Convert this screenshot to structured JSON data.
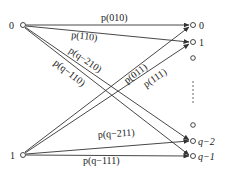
{
  "diagram": {
    "type": "channel transition diagram",
    "left_nodes": [
      {
        "id": "L0",
        "label": "0",
        "x": 23,
        "y": 25
      },
      {
        "id": "L1",
        "label": "1",
        "x": 23,
        "y": 155
      }
    ],
    "right_nodes": [
      {
        "id": "R0",
        "label": "0",
        "x": 193,
        "y": 25
      },
      {
        "id": "R1",
        "label": "1",
        "x": 193,
        "y": 42
      },
      {
        "id": "R2",
        "label": "",
        "x": 193,
        "y": 58
      },
      {
        "id": "Rdots",
        "label": "⋮",
        "x": 193,
        "y": 95
      },
      {
        "id": "R3",
        "label": "",
        "x": 193,
        "y": 125
      },
      {
        "id": "Rq2",
        "label": "q−2",
        "x": 193,
        "y": 141
      },
      {
        "id": "Rq1",
        "label": "q−1",
        "x": 193,
        "y": 156
      }
    ],
    "edges": [
      {
        "from": "L0",
        "to": "R0",
        "label": "p(010)"
      },
      {
        "from": "L0",
        "to": "R1",
        "label": "p(110)"
      },
      {
        "from": "L0",
        "to": "Rq2",
        "label": "p(q−210)"
      },
      {
        "from": "L0",
        "to": "Rq1",
        "label": "p(q−110)"
      },
      {
        "from": "L1",
        "to": "R0",
        "label": "p(011)"
      },
      {
        "from": "L1",
        "to": "R1",
        "label": "p(111)"
      },
      {
        "from": "L1",
        "to": "Rq2",
        "label": "p(q−211)"
      },
      {
        "from": "L1",
        "to": "Rq1",
        "label": "p(q−111)"
      }
    ]
  },
  "labels": {
    "left0": "0",
    "left1": "1",
    "right0": "0",
    "right1": "1",
    "rightq2": "q−2",
    "rightq1": "q−1",
    "e_010": "p(010)",
    "e_110": "p(110)",
    "e_q210": "p(q−210)",
    "e_q110": "p(q−110)",
    "e_011": "p(011)",
    "e_111": "p(111)",
    "e_q211": "p(q−211)",
    "e_q111": "p(q−111)"
  }
}
